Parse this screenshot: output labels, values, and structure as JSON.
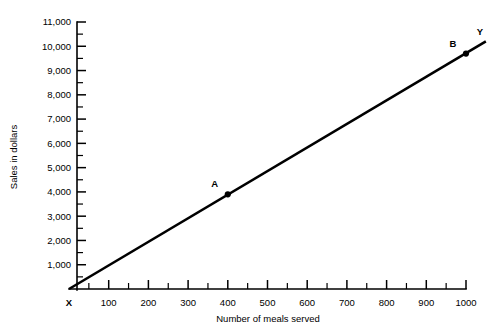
{
  "chart_data": {
    "type": "line",
    "title": "",
    "xlabel": "Number of meals served",
    "ylabel": "Sales in dollars",
    "xlim": [
      0,
      1000
    ],
    "ylim": [
      0,
      11000
    ],
    "grid": false,
    "legend": null,
    "x_ticks": [
      0,
      100,
      200,
      300,
      400,
      500,
      600,
      700,
      800,
      900,
      1000
    ],
    "x_tick_labels": [
      "X",
      "100",
      "200",
      "300",
      "400",
      "500",
      "600",
      "700",
      "800",
      "900",
      "1000"
    ],
    "x_minor_step": 50,
    "y_ticks": [
      1000,
      2000,
      3000,
      4000,
      5000,
      6000,
      7000,
      8000,
      9000,
      10000,
      11000
    ],
    "y_tick_labels": [
      "1,000",
      "2,000",
      "3,000",
      "4,000",
      "5,000",
      "6,000",
      "7,000",
      "8,000",
      "9,000",
      "10,000",
      "11,000"
    ],
    "y_minor_step": 500,
    "origin_label": "X",
    "line_end_label": "Y",
    "series": [
      {
        "name": "Sales trend line",
        "x": [
          0,
          1050
        ],
        "values": [
          0,
          10200
        ]
      }
    ],
    "annotations": [
      {
        "label": "A",
        "x": 400,
        "y": 3900
      },
      {
        "label": "B",
        "x": 1000,
        "y": 9700
      }
    ]
  }
}
